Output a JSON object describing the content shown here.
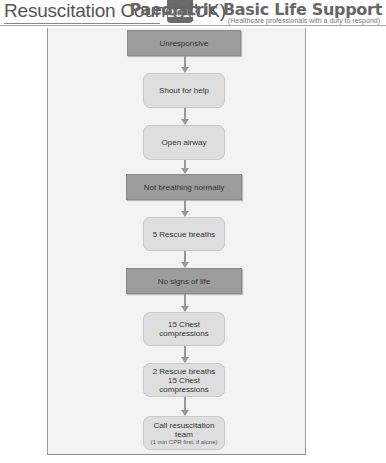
{
  "header": {
    "organization": "Resuscitation Council (UK)",
    "badge_year": "2015",
    "title": "Paediatric Basic Life Support",
    "subtitle": "(Healthcare professionals with a duty to respond)"
  },
  "flowchart": {
    "nodes": [
      {
        "id": "unresponsive",
        "label": "Unresponsive",
        "style": "dark"
      },
      {
        "id": "shout",
        "label": "Shout for help",
        "style": "light"
      },
      {
        "id": "airway",
        "label": "Open airway",
        "style": "light"
      },
      {
        "id": "not-breathing",
        "label": "Not breathing normally",
        "style": "dark"
      },
      {
        "id": "rescue-5",
        "label": "5 Rescue breaths",
        "style": "light"
      },
      {
        "id": "no-signs",
        "label": "No signs of life",
        "style": "dark"
      },
      {
        "id": "compressions-15",
        "label": "15 Chest compressions",
        "style": "light"
      },
      {
        "id": "cycle",
        "label": "2 Rescue breaths",
        "label2": "15 Chest compressions",
        "style": "light"
      },
      {
        "id": "call-team",
        "label": "Call resuscitation team",
        "note": "(1 min CPR first, if alone)",
        "style": "light"
      }
    ]
  },
  "colors": {
    "dark_box": "#9c9c9c",
    "light_box": "#dedede",
    "frame_bg": "#f3f3f3",
    "arrow": "#999999"
  }
}
